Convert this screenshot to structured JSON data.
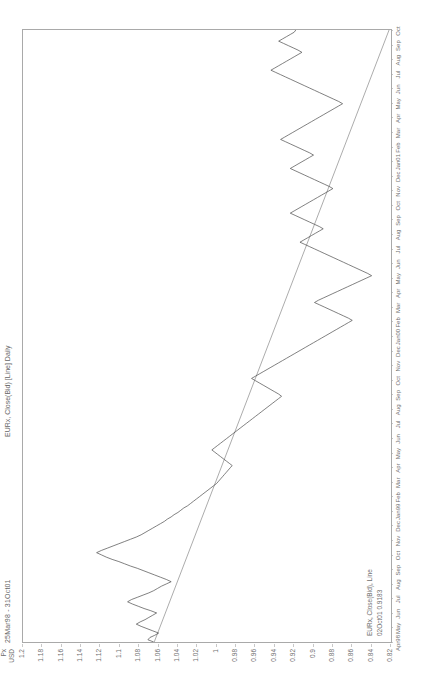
{
  "header": {
    "date_range": "25Mar98 - 31Oct01",
    "chart_title": "EURx, Close(Bid) [Line] Daily"
  },
  "legend": {
    "series_label": "EURx, Close(Bid), Line",
    "quote_label": "02Oct01 0.9183"
  },
  "axis": {
    "y_unit": "USD",
    "y_title": "Px"
  },
  "chart_data": {
    "type": "line",
    "title": "EURx, Close(Bid) [Line] Daily",
    "subtitle": "25Mar98 - 31Oct01",
    "xlabel": "",
    "ylabel": "Px USD",
    "ylim": [
      0.82,
      1.2
    ],
    "grid": false,
    "legend_position": "inside-bottom-left",
    "y_ticks": [
      "1.2",
      "1.18",
      "1.16",
      "1.14",
      "1.12",
      "1.1",
      "1.08",
      "1.06",
      "1.04",
      "1.02",
      "1",
      "0.98",
      "0.96",
      "0.94",
      "0.92",
      "0.9",
      "0.88",
      "0.86",
      "0.84",
      "0.82"
    ],
    "x_ticks": [
      "Apr98",
      "May",
      "Jun",
      "Jul",
      "Aug",
      "Sep",
      "Oct",
      "Nov",
      "Dec",
      "Jan99",
      "Feb",
      "Mar",
      "Apr",
      "May",
      "Jun",
      "Jul",
      "Aug",
      "Sep",
      "Oct",
      "Nov",
      "Dec",
      "Jan00",
      "Feb",
      "Mar",
      "Apr",
      "May",
      "Jun",
      "Jul",
      "Aug",
      "Sep",
      "Oct",
      "Nov",
      "Dec",
      "Jan01",
      "Feb",
      "Mar",
      "Apr",
      "May",
      "Jun",
      "Jul",
      "Aug",
      "Sep",
      "Oct"
    ],
    "series": [
      {
        "name": "EURx, Close(Bid), Line",
        "color": "#555555",
        "values": [
          1.065,
          1.071,
          1.069,
          1.064,
          1.06,
          1.066,
          1.072,
          1.078,
          1.083,
          1.079,
          1.074,
          1.07,
          1.066,
          1.062,
          1.068,
          1.075,
          1.081,
          1.087,
          1.092,
          1.088,
          1.082,
          1.076,
          1.07,
          1.065,
          1.061,
          1.057,
          1.052,
          1.047,
          1.052,
          1.058,
          1.064,
          1.07,
          1.076,
          1.082,
          1.089,
          1.095,
          1.101,
          1.108,
          1.114,
          1.119,
          1.124,
          1.119,
          1.113,
          1.107,
          1.101,
          1.095,
          1.089,
          1.083,
          1.078,
          1.074,
          1.07,
          1.066,
          1.062,
          1.058,
          1.054,
          1.051,
          1.047,
          1.044,
          1.04,
          1.037,
          1.034,
          1.03,
          1.027,
          1.024,
          1.021,
          1.018,
          1.015,
          1.012,
          1.009,
          1.006,
          1.003,
          1.0,
          0.998,
          0.996,
          0.994,
          0.992,
          0.99,
          0.988,
          0.986,
          0.984,
          0.987,
          0.99,
          0.993,
          0.996,
          0.999,
          1.002,
          1.005,
          1.002,
          0.999,
          0.996,
          0.993,
          0.99,
          0.987,
          0.984,
          0.981,
          0.978,
          0.975,
          0.972,
          0.969,
          0.966,
          0.963,
          0.96,
          0.957,
          0.954,
          0.951,
          0.948,
          0.945,
          0.942,
          0.939,
          0.936,
          0.933,
          0.936,
          0.94,
          0.944,
          0.948,
          0.952,
          0.956,
          0.96,
          0.964,
          0.96,
          0.956,
          0.952,
          0.948,
          0.944,
          0.94,
          0.936,
          0.932,
          0.928,
          0.924,
          0.92,
          0.916,
          0.912,
          0.908,
          0.904,
          0.9,
          0.896,
          0.892,
          0.888,
          0.884,
          0.88,
          0.876,
          0.872,
          0.868,
          0.864,
          0.86,
          0.864,
          0.869,
          0.874,
          0.879,
          0.884,
          0.889,
          0.894,
          0.899,
          0.895,
          0.89,
          0.885,
          0.88,
          0.875,
          0.87,
          0.865,
          0.86,
          0.855,
          0.85,
          0.845,
          0.84,
          0.844,
          0.849,
          0.854,
          0.859,
          0.864,
          0.869,
          0.874,
          0.879,
          0.884,
          0.889,
          0.894,
          0.899,
          0.904,
          0.909,
          0.914,
          0.91,
          0.906,
          0.902,
          0.898,
          0.894,
          0.89,
          0.894,
          0.899,
          0.904,
          0.909,
          0.914,
          0.919,
          0.924,
          0.92,
          0.916,
          0.912,
          0.908,
          0.904,
          0.9,
          0.896,
          0.892,
          0.888,
          0.884,
          0.88,
          0.884,
          0.889,
          0.894,
          0.899,
          0.904,
          0.909,
          0.914,
          0.919,
          0.924,
          0.92,
          0.916,
          0.912,
          0.908,
          0.904,
          0.9,
          0.904,
          0.909,
          0.914,
          0.919,
          0.924,
          0.929,
          0.934,
          0.93,
          0.926,
          0.922,
          0.918,
          0.914,
          0.91,
          0.906,
          0.902,
          0.898,
          0.894,
          0.89,
          0.886,
          0.882,
          0.878,
          0.874,
          0.87,
          0.874,
          0.879,
          0.884,
          0.889,
          0.894,
          0.899,
          0.904,
          0.909,
          0.914,
          0.919,
          0.924,
          0.929,
          0.934,
          0.939,
          0.944,
          0.94,
          0.936,
          0.932,
          0.928,
          0.924,
          0.92,
          0.916,
          0.912,
          0.916,
          0.921,
          0.926,
          0.931,
          0.936,
          0.932,
          0.928,
          0.924,
          0.92,
          0.9183
        ]
      },
      {
        "name": "Trendline",
        "color": "#777777",
        "type": "trendline",
        "start": [
          0,
          1.0645
        ],
        "end": [
          1,
          0.822
        ]
      }
    ]
  }
}
